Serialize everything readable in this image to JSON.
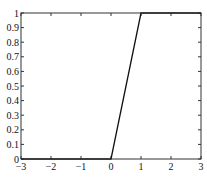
{
  "chart_data": {
    "type": "line",
    "title": "",
    "xlabel": "",
    "ylabel": "",
    "xlim": [
      -3,
      3
    ],
    "ylim": [
      0,
      1
    ],
    "grid": false,
    "x_ticks": [
      "−3",
      "−2",
      "−1",
      "0",
      "1",
      "2",
      "3"
    ],
    "y_ticks": [
      "0",
      "0.1",
      "0.2",
      "0.3",
      "0.4",
      "0.5",
      "0.6",
      "0.7",
      "0.8",
      "0.9",
      "1"
    ],
    "series": [
      {
        "name": "saturating linear",
        "x": [
          -3,
          0,
          1,
          3
        ],
        "y": [
          0,
          0,
          1,
          1
        ]
      }
    ],
    "colors": {
      "line": "#111111",
      "axes": "#333333"
    }
  }
}
